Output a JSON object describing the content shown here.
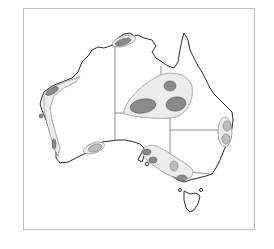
{
  "map": {
    "subject": "Australia",
    "style": "monochrome line map with shaded regions",
    "colors": {
      "frame": "#bdbdbd",
      "coastline": "#2a2a2a",
      "light_zone": "#ececec",
      "medium_zone": "#bdbdbd",
      "dark_zone": "#8a8a8a"
    },
    "regions": [
      {
        "name": "northern-territory-top-end",
        "shading": "dark"
      },
      {
        "name": "central-queensland-nt-large-zone",
        "shading": "light with three dark cores"
      },
      {
        "name": "western-australia-west-coast",
        "shading": "light strip with dark patches"
      },
      {
        "name": "south-coast-bight",
        "shading": "medium"
      },
      {
        "name": "south-australia-victoria",
        "shading": "light with dark cores"
      },
      {
        "name": "new-south-wales-east-coast",
        "shading": "light with two medium cores"
      }
    ]
  }
}
